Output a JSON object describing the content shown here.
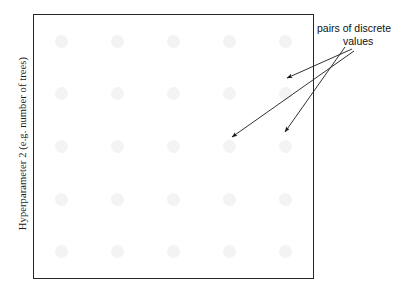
{
  "figure": {
    "type": "scatter-grid-schematic",
    "background_color": "#ffffff",
    "axis_label_y": "Hyperparameter 2 (e.g. number of trees)",
    "frame_color": "#262626",
    "dot_color": "#f3f3f4",
    "annotation_color": "#111111"
  },
  "annotation": {
    "line_1": "pairs of discrete",
    "line_2": "values",
    "full_text": "pairs of discrete values",
    "arrow_count": 3
  },
  "chart_data": {
    "type": "scatter",
    "title": "",
    "xlabel": "",
    "ylabel": "Hyperparameter 2 (e.g. number of trees)",
    "grid": false,
    "legend": "none",
    "xlim": [
      0,
      1
    ],
    "ylim": [
      0,
      1
    ],
    "x": [
      0.1,
      0.3,
      0.5,
      0.7,
      0.9,
      0.1,
      0.3,
      0.5,
      0.7,
      0.9,
      0.1,
      0.3,
      0.5,
      0.7,
      0.9,
      0.1,
      0.3,
      0.5,
      0.7,
      0.9,
      0.1,
      0.3,
      0.5,
      0.7,
      0.9
    ],
    "y": [
      0.9,
      0.9,
      0.9,
      0.9,
      0.9,
      0.7,
      0.7,
      0.7,
      0.7,
      0.7,
      0.5,
      0.5,
      0.5,
      0.5,
      0.5,
      0.3,
      0.3,
      0.3,
      0.3,
      0.3,
      0.1,
      0.1,
      0.1,
      0.1,
      0.1
    ],
    "x_levels": [
      0.1,
      0.3,
      0.5,
      0.7,
      0.9
    ],
    "y_levels": [
      0.1,
      0.3,
      0.5,
      0.7,
      0.9
    ],
    "n_points": 25,
    "annotations": [
      {
        "text": "pairs of discrete values",
        "points_to": [
          [
            0.7,
            0.76
          ],
          [
            0.885,
            0.545
          ],
          [
            0.7,
            0.53
          ]
        ]
      }
    ]
  }
}
